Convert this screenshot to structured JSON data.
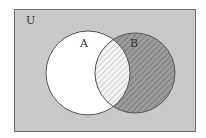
{
  "diagram": {
    "type": "venn",
    "universe_label": "U",
    "sets": [
      {
        "label": "A",
        "fill": "#ffffff"
      },
      {
        "label": "B",
        "fill": "#9c9c9c",
        "hatched": true
      }
    ],
    "shaded_regions": [
      "B",
      "A∩B (light hatch)"
    ],
    "colors": {
      "universe_fill": "#c9c9c9",
      "border": "#6b6b6b",
      "circle_stroke": "#555555",
      "b_fill": "#9c9c9c",
      "hatch_dark": "#6e6e6e",
      "hatch_light": "#b5b5b5",
      "intersection_fill": "#f4f4f4"
    }
  }
}
